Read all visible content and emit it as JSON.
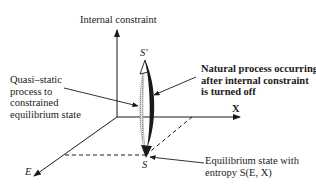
{
  "diagram": {
    "axes": {
      "vertical_label": "Internal constraint",
      "x_label": "X",
      "e_label": "E"
    },
    "points": {
      "s_prime": "S'",
      "s": "S"
    },
    "annotations": {
      "quasi_static": [
        "Quasi–static",
        "process to",
        "constrained",
        "equilibrium state"
      ],
      "natural_process": [
        "Natural process occurring",
        "after internal constraint",
        "is turned off"
      ],
      "equilibrium": [
        "Equilibrium state with",
        "entropy S(E, X)"
      ]
    },
    "colors": {
      "ink": "#1a1a1a",
      "hatched_path": "#9a9a9a",
      "background": "#ffffff"
    }
  }
}
